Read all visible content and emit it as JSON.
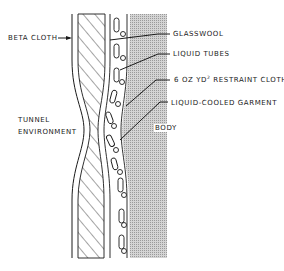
{
  "diagram": {
    "labels": {
      "beta_cloth": "BETA CLOTH",
      "glasswool": "GLASSWOOL",
      "liquid_tubes": "LIQUID TUBES",
      "restraint_cloth_prefix": "6 OZ YD",
      "restraint_cloth_sup": "2",
      "restraint_cloth_suffix": " RESTRAINT CLOTH",
      "liquid_cooled_garment": "LIQUID-COOLED GARMENT",
      "body": "BODY",
      "tunnel_line1": "TUNNEL",
      "tunnel_line2": "ENVIRONMENT"
    },
    "colors": {
      "ink": "#1a1a1a",
      "body_shade": "#c8c8c8",
      "background": "#ffffff"
    }
  }
}
